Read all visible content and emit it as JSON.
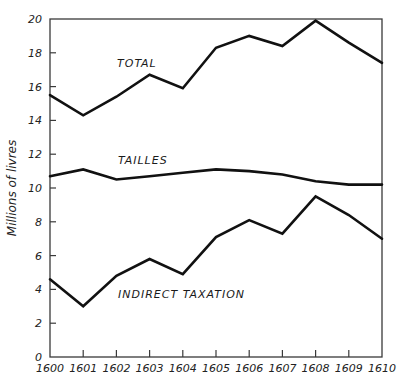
{
  "chart_data": {
    "type": "line",
    "title": "",
    "xlabel": "",
    "ylabel": "Millions of livres",
    "x": [
      1600,
      1601,
      1602,
      1603,
      1604,
      1605,
      1606,
      1607,
      1608,
      1609,
      1610
    ],
    "x_tick_labels": [
      "1600",
      "1601",
      "1602",
      "1603",
      "1604",
      "1605",
      "1606",
      "1607",
      "1608",
      "1609",
      "1610"
    ],
    "y_ticks": [
      0,
      2,
      4,
      6,
      8,
      10,
      12,
      14,
      16,
      18,
      20
    ],
    "y_tick_labels": [
      "0",
      "2",
      "4",
      "6",
      "8",
      "10",
      "12",
      "14",
      "16",
      "18",
      "20"
    ],
    "ylim": [
      0,
      20
    ],
    "xlim": [
      1600,
      1610
    ],
    "grid": false,
    "legend": "inline labels",
    "series": [
      {
        "name": "TOTAL",
        "values": [
          15.5,
          14.3,
          15.4,
          16.7,
          15.9,
          18.3,
          19.0,
          18.4,
          19.9,
          18.6,
          17.4
        ],
        "label_pos": {
          "x": 117,
          "y": 67
        }
      },
      {
        "name": "TAILLES",
        "values": [
          10.7,
          11.1,
          10.5,
          10.7,
          10.9,
          11.1,
          11.0,
          10.8,
          10.4,
          10.2,
          10.2
        ],
        "label_pos": {
          "x": 118,
          "y": 164
        }
      },
      {
        "name": "INDIRECT TAXATION",
        "values": [
          4.6,
          3.0,
          4.8,
          5.8,
          4.9,
          7.1,
          8.1,
          7.3,
          9.5,
          8.4,
          7.0
        ],
        "label_pos": {
          "x": 118,
          "y": 298
        }
      }
    ],
    "colors": {
      "line": "#111111",
      "axis": "#3a3a3a",
      "background": "#ffffff"
    }
  }
}
